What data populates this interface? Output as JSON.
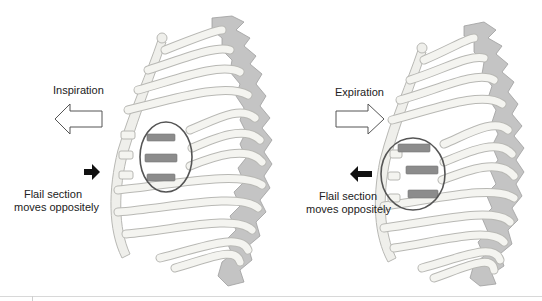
{
  "figure": {
    "panels": [
      {
        "id": "inspiration",
        "phase_label": "Inspiration",
        "phase_arrow": {
          "direction": "left",
          "style": "outline"
        },
        "flail_label_line1": "Flail section",
        "flail_label_line2": "moves oppositely",
        "flail_arrow": {
          "direction": "right",
          "style": "solid"
        },
        "flail_segment_position": "inward"
      },
      {
        "id": "expiration",
        "phase_label": "Expiration",
        "phase_arrow": {
          "direction": "right",
          "style": "outline"
        },
        "flail_label_line1": "Flail section",
        "flail_label_line2": "moves oppositely",
        "flail_arrow": {
          "direction": "left",
          "style": "solid"
        },
        "flail_segment_position": "outward"
      }
    ],
    "colors": {
      "rib_fill": "#f4f4f0",
      "rib_stroke": "#b8b8b4",
      "spine_fill": "#bdbdbd",
      "spine_stroke": "#9a9a9a",
      "flail_fragment": "#8c8c8c",
      "circle_outline": "#555555",
      "solid_arrow": "#111111",
      "outline_arrow_stroke": "#555555",
      "text": "#222222"
    }
  }
}
